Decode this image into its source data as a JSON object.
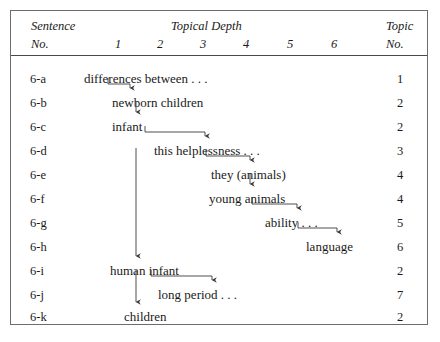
{
  "figure": {
    "header": {
      "sentence_label_line1": "Sentence",
      "sentence_label_line2": "No.",
      "topical_depth_label": "Topical Depth",
      "topic_label_line1": "Topic",
      "topic_label_line2": "No.",
      "depth_columns": [
        "1",
        "2",
        "3",
        "4",
        "5",
        "6"
      ]
    },
    "rows": [
      {
        "sentence_no": "6-a",
        "text": "differences between . . .",
        "depth": 1,
        "topic_no": "1"
      },
      {
        "sentence_no": "6-b",
        "text": "newborn children",
        "depth": 2,
        "topic_no": "2"
      },
      {
        "sentence_no": "6-c",
        "text": "infant",
        "depth": 2,
        "topic_no": "2"
      },
      {
        "sentence_no": "6-d",
        "text": "this helplessness . . .",
        "depth": 3,
        "topic_no": "3"
      },
      {
        "sentence_no": "6-e",
        "text": "they (animals)",
        "depth": 4,
        "topic_no": "4"
      },
      {
        "sentence_no": "6-f",
        "text": "young animals",
        "depth": 4,
        "topic_no": "4"
      },
      {
        "sentence_no": "6-g",
        "text": "ability . . .",
        "depth": 5,
        "topic_no": "5"
      },
      {
        "sentence_no": "6-h",
        "text": "language",
        "depth": 6,
        "topic_no": "6"
      },
      {
        "sentence_no": "6-i",
        "text": "human infant",
        "depth": 2,
        "topic_no": "2"
      },
      {
        "sentence_no": "6-j",
        "text": "long period . . .",
        "depth": 3,
        "topic_no": "7"
      },
      {
        "sentence_no": "6-k",
        "text": "children",
        "depth": 2,
        "topic_no": "2"
      }
    ],
    "colors": {
      "ink": "#1a1a1a",
      "rule": "#4a4a4a",
      "frame": "#6d6d6d",
      "connector": "#3a3a3a"
    }
  },
  "layout": {
    "node_x": [
      84,
      112,
      112,
      154,
      200,
      198,
      253,
      305,
      110,
      158,
      125
    ],
    "row_y": [
      72,
      96,
      120,
      144,
      168,
      192,
      216,
      240,
      264,
      288,
      310
    ],
    "depth_x": [
      118,
      160,
      203,
      246,
      290,
      334
    ]
  },
  "connectors": [
    {
      "name": "a-to-b",
      "type": "elbow",
      "x1": 108,
      "y1": 78,
      "x2": 130,
      "y2": 90
    },
    {
      "name": "b-to-c",
      "type": "straight",
      "x1": 136,
      "y1": 101,
      "x2": 136,
      "y2": 114
    },
    {
      "name": "c-to-d",
      "type": "elbow",
      "x1": 145,
      "y1": 126,
      "x2": 205,
      "y2": 138
    },
    {
      "name": "d-to-e",
      "type": "elbow",
      "x1": 206,
      "y1": 150,
      "x2": 250,
      "y2": 162
    },
    {
      "name": "e-to-f",
      "type": "straight",
      "x1": 250,
      "y1": 173,
      "x2": 250,
      "y2": 186
    },
    {
      "name": "f-to-g",
      "type": "elbow",
      "x1": 252,
      "y1": 198,
      "x2": 297,
      "y2": 210
    },
    {
      "name": "g-to-h",
      "type": "elbow",
      "x1": 298,
      "y1": 222,
      "x2": 337,
      "y2": 234
    },
    {
      "name": "c-to-i",
      "type": "straight",
      "x1": 136,
      "y1": 148,
      "x2": 136,
      "y2": 258
    },
    {
      "name": "i-to-j",
      "type": "elbow",
      "x1": 151,
      "y1": 270,
      "x2": 212,
      "y2": 282
    },
    {
      "name": "i-to-k",
      "type": "straight",
      "x1": 136,
      "y1": 270,
      "x2": 136,
      "y2": 304
    }
  ]
}
